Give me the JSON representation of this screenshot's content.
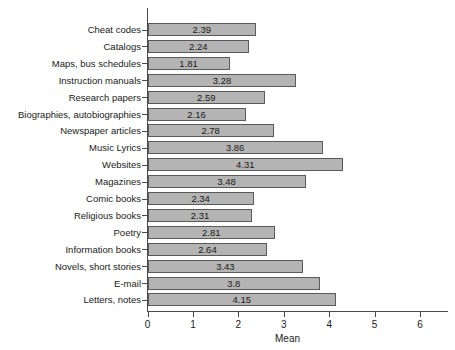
{
  "chart_data": {
    "type": "bar",
    "orientation": "horizontal",
    "title": "",
    "subtitle": "",
    "xlabel": "Mean",
    "ylabel": "",
    "xlim": [
      0,
      6
    ],
    "xticks": [
      0,
      1,
      2,
      3,
      4,
      5,
      6
    ],
    "xtick_labels": [
      "0",
      "1",
      "2",
      "3",
      "4",
      "5",
      "6"
    ],
    "grid": false,
    "legend": null,
    "bar_color": "#b4b4b4",
    "bar_border_color": "#5a5a5a",
    "axis_color": "#4a4a4a",
    "value_labels_shown": true,
    "categories": [
      "Cheat codes",
      "Catalogs",
      "Maps, bus schedules",
      "Instruction manuals",
      "Research papers",
      "Biographies, autobiographies",
      "Newspaper articles",
      "Music Lyrics",
      "Websites",
      "Magazines",
      "Comic books",
      "Religious books",
      "Poetry",
      "Information books",
      "Novels, short stories",
      "E-mail",
      "Letters, notes"
    ],
    "values": [
      2.39,
      2.24,
      1.81,
      3.28,
      2.59,
      2.16,
      2.78,
      3.86,
      4.31,
      3.48,
      2.34,
      2.31,
      2.81,
      2.64,
      3.43,
      3.8,
      4.15
    ],
    "value_labels": [
      "2.39",
      "2.24",
      "1.81",
      "3.28",
      "2.59",
      "2.16",
      "2.78",
      "3.86",
      "4.31",
      "3.48",
      "2.34",
      "2.31",
      "2.81",
      "2.64",
      "3.43",
      "3.8",
      "4.15"
    ]
  }
}
